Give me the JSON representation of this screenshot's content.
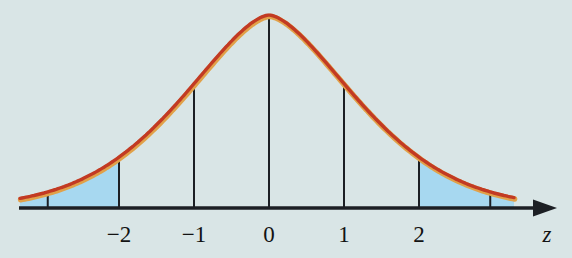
{
  "chart_data": {
    "type": "area",
    "title": "",
    "xlabel": "z",
    "ylabel": "",
    "grid": false,
    "legend": null,
    "x_ticks": [
      {
        "z": -2,
        "label": "−2"
      },
      {
        "z": -1,
        "label": "−1"
      },
      {
        "z": 0,
        "label": "0"
      },
      {
        "z": 1,
        "label": "1"
      },
      {
        "z": 2,
        "label": "2"
      }
    ],
    "minor_ticks": [
      {
        "z": -2.95,
        "label": ""
      },
      {
        "z": 2.95,
        "label": ""
      }
    ],
    "vertical_lines_z": [
      -2,
      -1,
      0,
      1,
      2
    ],
    "shaded_regions": [
      {
        "from_z": -3.32,
        "to_z": -2
      },
      {
        "from_z": 2,
        "to_z": 3.27
      }
    ],
    "curve_samples": [
      {
        "z": -3.3,
        "density_rel": 0.05
      },
      {
        "z": -2.95,
        "density_rel": 0.08
      },
      {
        "z": -2,
        "density_rel": 0.25
      },
      {
        "z": -1,
        "density_rel": 0.65
      },
      {
        "z": 0,
        "density_rel": 1.0
      },
      {
        "z": 1,
        "density_rel": 0.65
      },
      {
        "z": 2,
        "density_rel": 0.25
      },
      {
        "z": 2.95,
        "density_rel": 0.08
      },
      {
        "z": 3.27,
        "density_rel": 0.05
      }
    ],
    "axis": {
      "arrow": "right",
      "label_italic": true
    },
    "colors": {
      "background": "#d9e5e6",
      "shade": "#a7d8f0",
      "curve": "#c23a23",
      "curve_fringe": "#e1a149",
      "line": "#1c1f24",
      "text": "#131313"
    },
    "geometry": {
      "width": 572,
      "height": 258,
      "center_x": 269,
      "px_per_z": 75,
      "baseline_y": 208,
      "peak_height_px": 193,
      "shape_a": 0.44,
      "shape_p": 1.6,
      "curve_x_min": 20,
      "curve_x_max": 514,
      "axis_x_start": 19,
      "axis_x_end": 540,
      "arrow_tip_x": 557,
      "arrow_back_x": 533,
      "arrow_half_height": 8.5,
      "label_y": 242,
      "zlabel_x": 547
    }
  }
}
